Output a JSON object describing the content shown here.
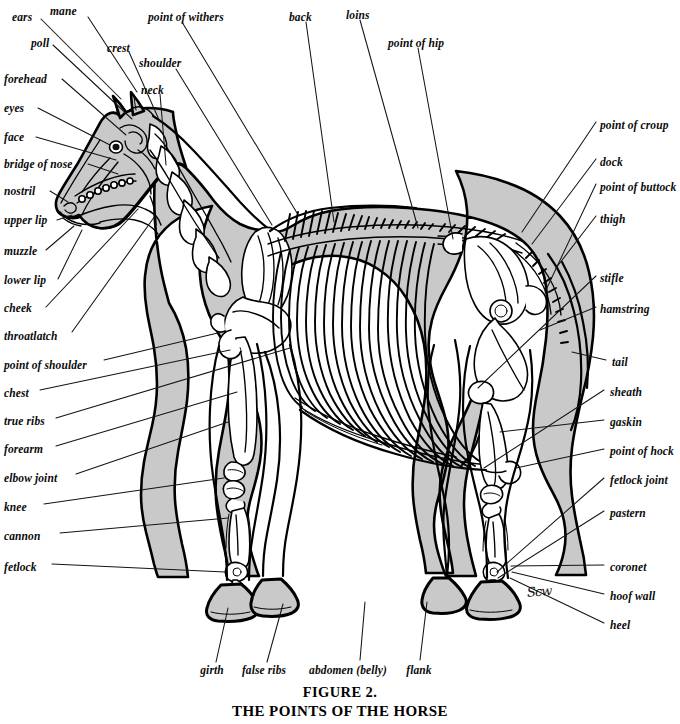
{
  "figure": {
    "caption_line1": "FIGURE 2.",
    "caption_line2": "THE POINTS OF THE HORSE",
    "artist_signature": "Scw",
    "colors": {
      "body_fill": "#c9c9c9",
      "outline": "#000000",
      "background": "#ffffff",
      "leader_line": "#111111"
    }
  },
  "labels": {
    "top": [
      {
        "id": "ears",
        "text": "ears",
        "x": 12,
        "y": 12
      },
      {
        "id": "mane",
        "text": "mane",
        "x": 50,
        "y": 8
      },
      {
        "id": "point-of-withers",
        "text": "point of withers",
        "x": 148,
        "y": 14
      },
      {
        "id": "back",
        "text": "back",
        "x": 289,
        "y": 14
      },
      {
        "id": "loins",
        "text": "loins",
        "x": 346,
        "y": 12
      },
      {
        "id": "point-of-hip",
        "text": "point of hip",
        "x": 388,
        "y": 40
      },
      {
        "id": "poll",
        "text": "poll",
        "x": 31,
        "y": 38
      },
      {
        "id": "crest",
        "text": "crest",
        "x": 107,
        "y": 44
      },
      {
        "id": "shoulder",
        "text": "shoulder",
        "x": 139,
        "y": 60
      },
      {
        "id": "neck",
        "text": "neck",
        "x": 141,
        "y": 86
      }
    ],
    "left": [
      {
        "id": "forehead",
        "text": "forehead",
        "x": 4,
        "y": 79
      },
      {
        "id": "eyes",
        "text": "eyes",
        "x": 4,
        "y": 108
      },
      {
        "id": "face",
        "text": "face",
        "x": 4,
        "y": 137
      },
      {
        "id": "bridge-of-nose",
        "text": "bridge of nose",
        "x": 4,
        "y": 164
      },
      {
        "id": "nostril",
        "text": "nostril",
        "x": 4,
        "y": 191
      },
      {
        "id": "upper-lip",
        "text": "upper lip",
        "x": 4,
        "y": 220
      },
      {
        "id": "muzzle",
        "text": "muzzle",
        "x": 4,
        "y": 252
      },
      {
        "id": "lower-lip",
        "text": "lower lip",
        "x": 4,
        "y": 281
      },
      {
        "id": "cheek",
        "text": "cheek",
        "x": 4,
        "y": 309
      },
      {
        "id": "throatlatch",
        "text": "throatlatch",
        "x": 4,
        "y": 337
      },
      {
        "id": "point-of-shoulder",
        "text": "point of shoulder",
        "x": 4,
        "y": 366
      },
      {
        "id": "chest",
        "text": "chest",
        "x": 4,
        "y": 394
      },
      {
        "id": "true-ribs",
        "text": "true ribs",
        "x": 4,
        "y": 422
      },
      {
        "id": "forearm",
        "text": "forearm",
        "x": 4,
        "y": 450
      },
      {
        "id": "elbow-joint",
        "text": "elbow joint",
        "x": 4,
        "y": 479
      },
      {
        "id": "knee",
        "text": "knee",
        "x": 4,
        "y": 508
      },
      {
        "id": "cannon",
        "text": "cannon",
        "x": 4,
        "y": 537
      },
      {
        "id": "fetlock",
        "text": "fetlock",
        "x": 4,
        "y": 568
      }
    ],
    "right": [
      {
        "id": "point-of-croup",
        "text": "point of croup",
        "x": 600,
        "y": 126
      },
      {
        "id": "dock",
        "text": "dock",
        "x": 600,
        "y": 163
      },
      {
        "id": "point-of-buttock",
        "text": "point of buttock",
        "x": 600,
        "y": 188
      },
      {
        "id": "thigh",
        "text": "thigh",
        "x": 600,
        "y": 220
      },
      {
        "id": "stifle",
        "text": "stifle",
        "x": 600,
        "y": 279
      },
      {
        "id": "hamstring",
        "text": "hamstring",
        "x": 600,
        "y": 310
      },
      {
        "id": "tail",
        "text": "tail",
        "x": 612,
        "y": 363
      },
      {
        "id": "sheath",
        "text": "sheath",
        "x": 610,
        "y": 393
      },
      {
        "id": "gaskin",
        "text": "gaskin",
        "x": 610,
        "y": 423
      },
      {
        "id": "point-of-hock",
        "text": "point of hock",
        "x": 610,
        "y": 452
      },
      {
        "id": "fetlock-joint",
        "text": "fetlock joint",
        "x": 610,
        "y": 481
      },
      {
        "id": "pastern",
        "text": "pastern",
        "x": 610,
        "y": 514
      },
      {
        "id": "coronet",
        "text": "coronet",
        "x": 610,
        "y": 568
      },
      {
        "id": "hoof-wall",
        "text": "hoof wall",
        "x": 610,
        "y": 597
      },
      {
        "id": "heel",
        "text": "heel",
        "x": 610,
        "y": 626
      }
    ],
    "bottom": [
      {
        "id": "girth",
        "text": "girth",
        "x": 212,
        "y": 670
      },
      {
        "id": "false-ribs",
        "text": "false ribs",
        "x": 264,
        "y": 670
      },
      {
        "id": "abdomen-belly",
        "text": "abdomen (belly)",
        "x": 348,
        "y": 670
      },
      {
        "id": "flank",
        "text": "flank",
        "x": 419,
        "y": 670
      }
    ]
  },
  "leader_lines": {
    "description": "Thin straight pointer lines from each label to its anatomical location on the horse"
  }
}
